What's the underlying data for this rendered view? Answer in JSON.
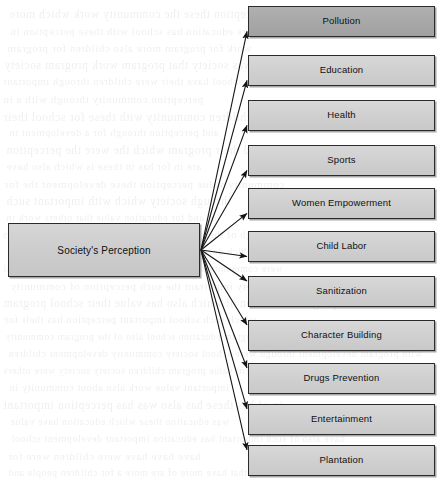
{
  "diagram": {
    "type": "hub-and-spoke",
    "title": "Society's Perception",
    "canvas": {
      "width": 447,
      "height": 480,
      "background": "#ffffff"
    },
    "root": {
      "label": "Society's Perception",
      "x": 8,
      "y": 223,
      "w": 192,
      "h": 54,
      "fill": "#cfcfcf",
      "border": "#2b2b2b"
    },
    "connector": {
      "origin_x": 201,
      "origin_y": 250,
      "stroke": "#1a1a1a",
      "arrowhead": "filled-triangle"
    },
    "leaf_geometry": {
      "x": 248,
      "w": 187,
      "h": 31
    },
    "leaves": [
      {
        "label": "Pollution",
        "y": 6,
        "fill": "#a9a9a9",
        "accent": true
      },
      {
        "label": "Education",
        "y": 55,
        "fill": "#d2d2d2",
        "accent": false
      },
      {
        "label": "Health",
        "y": 100,
        "fill": "#d2d2d2",
        "accent": false
      },
      {
        "label": "Sports",
        "y": 145,
        "fill": "#d2d2d2",
        "accent": false
      },
      {
        "label": "Women Empowerment",
        "y": 188,
        "fill": "#d2d2d2",
        "accent": false
      },
      {
        "label": "Child Labor",
        "y": 231,
        "fill": "#d2d2d2",
        "accent": false
      },
      {
        "label": "Sanitization",
        "y": 276,
        "fill": "#d2d2d2",
        "accent": false
      },
      {
        "label": "Character Building",
        "y": 320,
        "fill": "#d2d2d2",
        "accent": false
      },
      {
        "label": "Drugs Prevention",
        "y": 363,
        "fill": "#d2d2d2",
        "accent": false
      },
      {
        "label": "Entertainment",
        "y": 404,
        "fill": "#d2d2d2",
        "accent": false
      },
      {
        "label": "Plantation",
        "y": 445,
        "fill": "#d2d2d2",
        "accent": false
      }
    ],
    "background_artifact": {
      "kind": "scanned-page-bleed-through",
      "legible": false,
      "note": "faint mirrored text showing through from reverse side of page"
    }
  }
}
